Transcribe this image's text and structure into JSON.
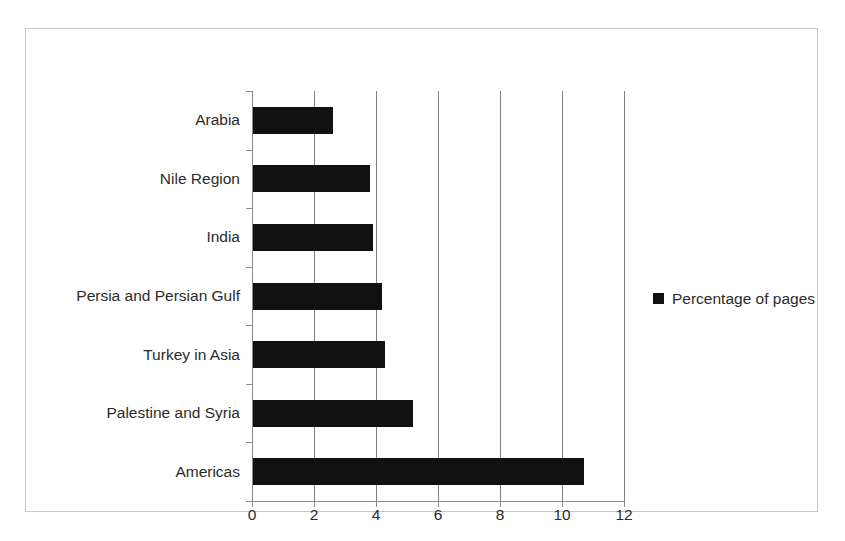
{
  "chart_data": {
    "type": "bar",
    "orientation": "horizontal",
    "title": "",
    "xlabel": "",
    "ylabel": "",
    "categories": [
      "Arabia",
      "Nile Region",
      "India",
      "Persia and Persian Gulf",
      "Turkey in Asia",
      "Palestine and Syria",
      "Americas"
    ],
    "values": [
      2.6,
      3.8,
      3.9,
      4.2,
      4.3,
      5.2,
      10.7
    ],
    "series": [
      {
        "name": "Percentage of pages",
        "values": [
          2.6,
          3.8,
          3.9,
          4.2,
          4.3,
          5.2,
          10.7
        ]
      }
    ],
    "xlim": [
      0,
      12
    ],
    "xticks": [
      0,
      2,
      4,
      6,
      8,
      10,
      12
    ],
    "xtick_labels": [
      "0",
      "2",
      "4",
      "6",
      "8",
      "10",
      "12"
    ],
    "grid": "vertical",
    "legend": {
      "entries": [
        "Percentage of pages"
      ],
      "position": "right"
    },
    "colors": {
      "bar": "#111111",
      "gridline": "#7f7f7f",
      "axis": "#8a8a8a",
      "text": "#2b2b2b",
      "frame": "#c9c9c9",
      "background": "#ffffff"
    }
  }
}
